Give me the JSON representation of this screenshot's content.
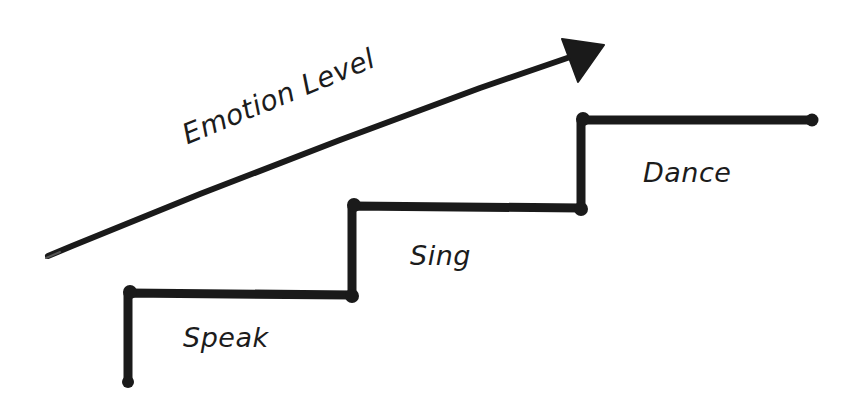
{
  "diagram": {
    "type": "staircase",
    "axis": {
      "label": "Emotion Level",
      "direction": "increasing toward upper-right",
      "arrow_color": "#1a1a1a"
    },
    "steps": [
      {
        "label": "Speak",
        "level": 1
      },
      {
        "label": "Sing",
        "level": 2
      },
      {
        "label": "Dance",
        "level": 3
      }
    ],
    "line_color": "#1a1a1a",
    "background": "#ffffff"
  }
}
